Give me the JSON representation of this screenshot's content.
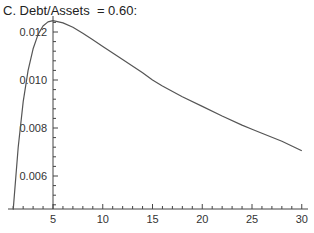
{
  "title": "C. Debt/Assets  = 0.60:",
  "chart_data": {
    "type": "line",
    "title": "C. Debt/Assets  = 0.60:",
    "xlabel": "",
    "ylabel": "",
    "xlim": [
      0,
      30.5
    ],
    "ylim": [
      0.0046,
      0.0125
    ],
    "grid": false,
    "x_ticks": [
      5,
      10,
      15,
      20,
      25,
      30
    ],
    "y_ticks": [
      0.006,
      0.008,
      0.01,
      0.012
    ],
    "x_tick_labels": [
      "5",
      "10",
      "15",
      "20",
      "25",
      "30"
    ],
    "y_tick_labels": [
      "0.006",
      "0.008",
      "0.010",
      "0.012"
    ],
    "series": [
      {
        "name": "curve",
        "color": "#555555",
        "x": [
          1.0,
          1.5,
          2,
          2.5,
          3,
          3.5,
          4,
          4.5,
          5,
          6,
          7,
          8,
          9,
          10,
          12,
          14,
          15,
          16,
          18,
          20,
          22,
          24,
          25,
          26,
          28,
          30
        ],
        "y": [
          0.0046,
          0.0072,
          0.0091,
          0.0104,
          0.0113,
          0.0119,
          0.01225,
          0.01242,
          0.01247,
          0.01238,
          0.0122,
          0.01195,
          0.01168,
          0.0114,
          0.01085,
          0.0103,
          0.01,
          0.00975,
          0.0093,
          0.0089,
          0.0085,
          0.00812,
          0.00795,
          0.00778,
          0.00745,
          0.00705
        ]
      }
    ]
  }
}
